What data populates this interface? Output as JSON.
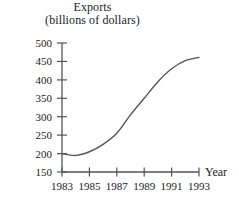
{
  "chart_data": {
    "type": "line",
    "title": "Exports",
    "subtitle": "(billions of dollars)",
    "xlabel": "Year",
    "ylabel": "",
    "xlim": [
      1983,
      1993
    ],
    "ylim": [
      150,
      500
    ],
    "grid": false,
    "legend": "none",
    "line_color": "#555555",
    "axis_color": "#555555",
    "x_ticks": [
      1983,
      1985,
      1987,
      1989,
      1991,
      1993
    ],
    "x_tick_labels": [
      "1983",
      "1985",
      "1987",
      "1989",
      "1991",
      "1993"
    ],
    "y_ticks": [
      150,
      200,
      250,
      300,
      350,
      400,
      450,
      500
    ],
    "y_tick_labels": [
      "150",
      "200",
      "250",
      "300",
      "350",
      "400",
      "450",
      "500"
    ],
    "x": [
      1983,
      1984,
      1985,
      1986,
      1987,
      1988,
      1989,
      1990,
      1991,
      1992,
      1993
    ],
    "values": [
      200,
      195,
      205,
      225,
      255,
      305,
      350,
      395,
      430,
      452,
      461
    ],
    "series": [
      {
        "name": "Exports",
        "values": [
          200,
          195,
          205,
          225,
          255,
          305,
          350,
          395,
          430,
          452,
          461
        ]
      }
    ]
  }
}
